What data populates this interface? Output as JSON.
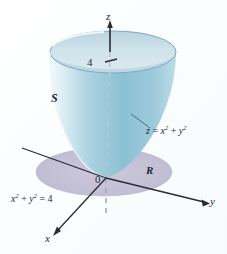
{
  "figure": {
    "background_color": "#fdfefe"
  },
  "axes": {
    "z_label": "z",
    "y_label": "y",
    "x_label": "x",
    "origin_label": "0",
    "z_tick_value": "4",
    "axis_color": "#2b2b33",
    "dashed_axis_color": "#a9a9b8"
  },
  "labels": {
    "surface_name": "S",
    "region_name": "R",
    "surface_equation_lhs": "z",
    "surface_equation_op1": " = ",
    "surface_equation_x": "x",
    "surface_equation_xexp": "2",
    "surface_equation_op2": " + ",
    "surface_equation_y": "y",
    "surface_equation_yexp": "2",
    "circle_equation_x": "x",
    "circle_equation_xexp": "2",
    "circle_equation_op1": " + ",
    "circle_equation_y": "y",
    "circle_equation_yexp": "2",
    "circle_equation_op2": " = ",
    "circle_equation_rhs": "4"
  },
  "colors": {
    "paraboloid_outer_light": "#eaf4f7",
    "paraboloid_outer_mid": "#9dc9dc",
    "paraboloid_outer_deep": "#7fb8cf",
    "paraboloid_inner_light": "#cfe4ec",
    "paraboloid_inner_deep": "#a7c6d6",
    "rim_stroke": "#7aa8bc",
    "region_disk": "#c5c2d6",
    "region_disk_edge": "#b3b0c8",
    "label_text": "#1d2a3a"
  },
  "geometry": {
    "origin_px": [
      106,
      178
    ],
    "rim_center_px": [
      113,
      52
    ],
    "rim_radius_x": 63,
    "rim_radius_y": 21,
    "disk_center_px": [
      104,
      172
    ],
    "disk_radius_x": 68,
    "disk_radius_y": 24,
    "z_tick_height_value": 4
  }
}
